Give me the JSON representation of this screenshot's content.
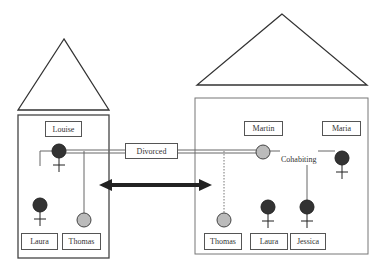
{
  "households": [
    {
      "name": "left-household",
      "members": [
        {
          "name": "Louise",
          "gender": "female"
        },
        {
          "name": "Laura",
          "gender": "female"
        },
        {
          "name": "Thomas",
          "gender": "male"
        }
      ]
    },
    {
      "name": "right-household",
      "members": [
        {
          "name": "Martin",
          "gender": "male"
        },
        {
          "name": "Maria",
          "gender": "female"
        },
        {
          "name": "Thomas",
          "gender": "male"
        },
        {
          "name": "Laura",
          "gender": "female"
        },
        {
          "name": "Jessica",
          "gender": "female"
        }
      ]
    }
  ],
  "labels": {
    "louise": "Louise",
    "laura_left": "Laura",
    "thomas_left": "Thomas",
    "martin": "Martin",
    "maria": "Maria",
    "thomas_right": "Thomas",
    "laura_right": "Laura",
    "jessica": "Jessica",
    "divorced": "Divorced",
    "cohabiting": "Cohabiting"
  },
  "colors": {
    "female_fill": "#333333",
    "male_fill": "#bbbbbb",
    "line": "#444444"
  }
}
